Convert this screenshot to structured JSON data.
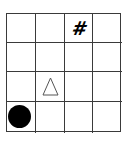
{
  "board": {
    "rows": 4,
    "cols": 4,
    "line_color": "#3a3a3a",
    "background": "#ffffff",
    "pieces": [
      {
        "row": 0,
        "col": 2,
        "type": "hash",
        "symbol": "#",
        "color": "#000000"
      },
      {
        "row": 2,
        "col": 1,
        "type": "triangle-outline",
        "symbol": "△",
        "color": "#555555"
      },
      {
        "row": 3,
        "col": 0,
        "type": "circle-filled",
        "symbol": "●",
        "color": "#000000"
      }
    ]
  },
  "labels": {
    "hash": "#"
  }
}
